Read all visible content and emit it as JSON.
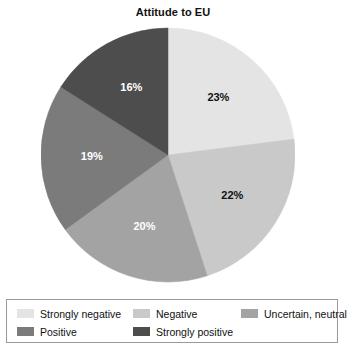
{
  "chart": {
    "title": "Attitude to EU"
  },
  "chart_data": {
    "type": "pie",
    "title": "Attitude to EU",
    "xlabel": "",
    "ylabel": "",
    "legend_position": "bottom",
    "grid": false,
    "start_angle_deg": 0,
    "direction": "clockwise",
    "categories": [
      "Strongly negative",
      "Negative",
      "Uncertain, neutral",
      "Positive",
      "Strongly positive"
    ],
    "values": [
      23,
      22,
      20,
      19,
      16
    ],
    "value_unit": "%",
    "value_labels": [
      "23%",
      "22%",
      "20%",
      "19%",
      "16%"
    ],
    "colors": [
      "#e4e4e4",
      "#c9c9c9",
      "#a3a3a3",
      "#7b7b7b",
      "#4d4d4d"
    ],
    "label_text_colors": [
      "#111111",
      "#111111",
      "#ffffff",
      "#ffffff",
      "#ffffff"
    ],
    "slices": [
      {
        "label": "Strongly negative",
        "value": 23,
        "value_label": "23%",
        "color": "#e4e4e4",
        "label_color": "#111111"
      },
      {
        "label": "Negative",
        "value": 22,
        "value_label": "22%",
        "color": "#c9c9c9",
        "label_color": "#111111"
      },
      {
        "label": "Uncertain, neutral",
        "value": 20,
        "value_label": "20%",
        "color": "#a3a3a3",
        "label_color": "#ffffff"
      },
      {
        "label": "Positive",
        "value": 19,
        "value_label": "19%",
        "color": "#7b7b7b",
        "label_color": "#ffffff"
      },
      {
        "label": "Strongly positive",
        "value": 16,
        "value_label": "16%",
        "color": "#4d4d4d",
        "label_color": "#ffffff"
      }
    ]
  },
  "legend": {
    "rows": [
      [
        {
          "label": "Strongly negative",
          "color": "#e4e4e4"
        },
        {
          "label": "Negative",
          "color": "#c9c9c9"
        },
        {
          "label": "Uncertain, neutral",
          "color": "#a3a3a3"
        }
      ],
      [
        {
          "label": "Positive",
          "color": "#7b7b7b"
        },
        {
          "label": "Strongly positive",
          "color": "#4d4d4d"
        }
      ]
    ]
  }
}
